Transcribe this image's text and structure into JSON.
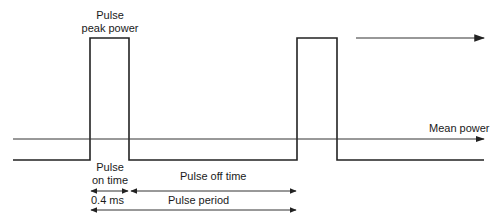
{
  "diagram": {
    "type": "pulse-waveform",
    "labels": {
      "peak_power_line1": "Pulse",
      "peak_power_line2": "peak power",
      "mean_power": "Mean power",
      "on_time_line1": "Pulse",
      "on_time_line2": "on time",
      "off_time": "Pulse off time",
      "on_time_value": "0.4 ms",
      "period": "Pulse period"
    },
    "colors": {
      "stroke": "#222222",
      "background": "#ffffff"
    }
  }
}
